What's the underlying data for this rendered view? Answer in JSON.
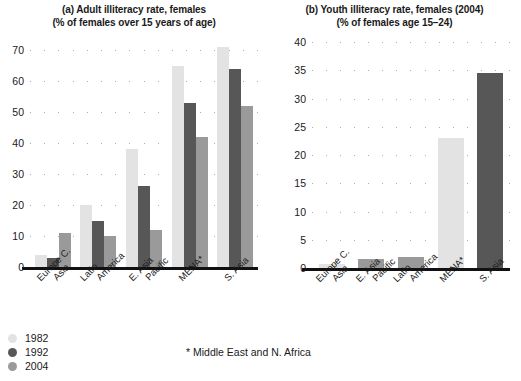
{
  "colors": {
    "y1982": "#e3e3e3",
    "y1992": "#575757",
    "y2004": "#9a9a9a",
    "axis": "#111111",
    "grid": "#aaaaaa"
  },
  "legend": {
    "items": [
      {
        "label": "1982",
        "color": "#e3e3e3"
      },
      {
        "label": "1992",
        "color": "#575757"
      },
      {
        "label": "2004",
        "color": "#9a9a9a"
      }
    ]
  },
  "footnote": "* Middle East and N. Africa",
  "panel_a": {
    "title_line1": "(a) Adult illiteracy rate, females",
    "title_line2": "(% of females over 15 years of age)"
  },
  "panel_b": {
    "title_line1": "(b) Youth illiteracy rate, females (2004)",
    "title_line2": "(% of females age 15–24)"
  },
  "chart_data": [
    {
      "type": "bar",
      "id": "panel-a",
      "title": "(a) Adult illiteracy rate, females",
      "subtitle": "(% of females over 15 years of age)",
      "xlabel": "",
      "ylabel": "",
      "ylim": [
        0,
        70
      ],
      "yticks": [
        0,
        10,
        20,
        30,
        40,
        50,
        60,
        70
      ],
      "ytick_labels": [
        "0",
        "10",
        "20",
        "30",
        "40",
        "50",
        "60",
        "70"
      ],
      "grid": true,
      "legend_position": "bottom-left",
      "categories": [
        "Europe C. Asia",
        "Latin America",
        "E. Asia Pacific",
        "MENA*",
        "S. Asia"
      ],
      "category_lines": [
        [
          "Europe C.",
          "Asia"
        ],
        [
          "Latin",
          "America"
        ],
        [
          "E. Asia",
          "Pacific"
        ],
        [
          "MENA*"
        ],
        [
          "S. Asia"
        ]
      ],
      "series": [
        {
          "name": "1982",
          "color": "#e3e3e3",
          "values": [
            4,
            20,
            38,
            65,
            71
          ]
        },
        {
          "name": "1992",
          "color": "#575757",
          "values": [
            3,
            15,
            26,
            53,
            64
          ]
        },
        {
          "name": "2004",
          "color": "#9a9a9a",
          "values": [
            11,
            10,
            12,
            42,
            52
          ]
        }
      ]
    },
    {
      "type": "bar",
      "id": "panel-b",
      "title": "(b) Youth illiteracy rate, females (2004)",
      "subtitle": "(% of females age 15–24)",
      "xlabel": "",
      "ylabel": "",
      "ylim": [
        0,
        40
      ],
      "yticks": [
        0,
        5,
        10,
        15,
        20,
        25,
        30,
        35,
        40
      ],
      "ytick_labels": [
        "0",
        "5",
        "10",
        "15",
        "20",
        "25",
        "30",
        "35",
        "40"
      ],
      "grid": true,
      "legend_position": "none",
      "categories": [
        "Europe C. Asia",
        "E. Asia Pacific",
        "Latin America",
        "MENA*",
        "S. Asia"
      ],
      "category_lines": [
        [
          "Europe C.",
          "Asia"
        ],
        [
          "E. Asia",
          "Pacific"
        ],
        [
          "Latin",
          "America"
        ],
        [
          "MENA*"
        ],
        [
          "S. Asia"
        ]
      ],
      "series": [
        {
          "name": "2004",
          "values": [
            0.7,
            1.6,
            2.0,
            23,
            34.6
          ],
          "colors": [
            "#e3e3e3",
            "#9a9a9a",
            "#9a9a9a",
            "#e3e3e3",
            "#575757"
          ]
        }
      ]
    }
  ]
}
